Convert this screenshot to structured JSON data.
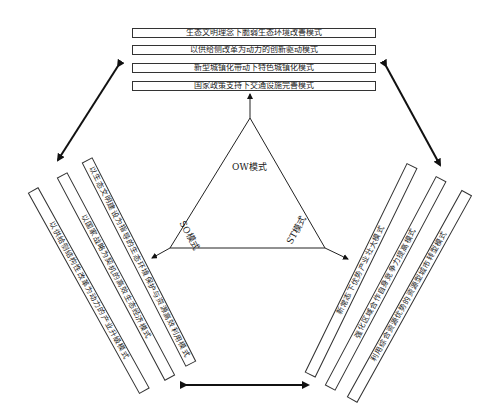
{
  "top_boxes": [
    {
      "label": "生态文明理念下脆弱生态环境改善模式"
    },
    {
      "label": "以供给侧改革为动力的创新驱动模式"
    },
    {
      "label": "新型城镇化带动下特色城镇化模式"
    },
    {
      "label": "国家政策支持下交通设施完善模式"
    }
  ],
  "left_boxes": [
    {
      "label": "以生态文明建设为指导的生态环境保护与资源高效利用模式"
    },
    {
      "label": "以国家战略为契机的高效生态经济模式"
    },
    {
      "label": "以供给侧结构性改革为动力的产业升级模式"
    }
  ],
  "right_boxes": [
    {
      "label": "新常态下优势产业壮大模式"
    },
    {
      "label": "强化区域合作自身竞争力提高模式"
    },
    {
      "label": "利用综合资源优势的资源型城市转型模式"
    }
  ],
  "triangle": {
    "top_label": "OW模式",
    "left_label": "SO模式",
    "right_label": "ST模式"
  },
  "colors": {
    "line": "#222222",
    "box_border": "#333333",
    "background": "#ffffff"
  }
}
